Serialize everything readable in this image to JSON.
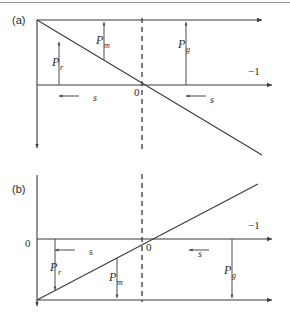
{
  "figure": {
    "panels": [
      {
        "id": "a",
        "label": "(a)",
        "axis_right_label": "−1",
        "origin_label": "0",
        "slope_sign": "negative",
        "shift_arrow_label": "s",
        "shift_arrow_direction": "left",
        "shift_arrows": 2,
        "markers": [
          {
            "name": "P_r",
            "base": "P",
            "sub": "r",
            "direction": "up"
          },
          {
            "name": "P_m",
            "base": "P",
            "sub": "m",
            "direction": "up"
          },
          {
            "name": "P_g",
            "base": "P",
            "sub": "g",
            "direction": "up"
          }
        ]
      },
      {
        "id": "b",
        "label": "(b)",
        "axis_right_label": "−1",
        "origin_label": "0",
        "left_axis_label": "0",
        "slope_sign": "positive",
        "shift_arrow_label": "s",
        "shift_arrow_direction": "left",
        "shift_arrows": 2,
        "markers": [
          {
            "name": "P_r",
            "base": "P",
            "sub": "r",
            "direction": "down"
          },
          {
            "name": "P_m",
            "base": "P",
            "sub": "m",
            "direction": "down"
          },
          {
            "name": "P_g",
            "base": "P",
            "sub": "g",
            "direction": "down"
          }
        ]
      }
    ],
    "colors": {
      "line": "#3a3a3a",
      "text": "#2b2b2b",
      "rule": "#9a9a9a",
      "background": "#ffffff"
    }
  }
}
